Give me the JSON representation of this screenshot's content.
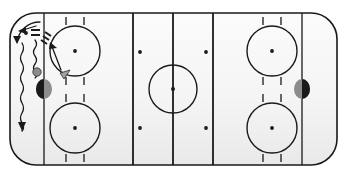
{
  "diagram": {
    "kind": "ice-hockey-rink-drill",
    "canvas": {
      "width": 347,
      "height": 178
    },
    "colors": {
      "ice_fill": "#f6f6f6",
      "ice_fill_shadow": "#ececec",
      "line_stroke": "#1a1a1a",
      "board_stroke": "#1a1a1a",
      "marker_dark": "#1a1a1a",
      "marker_gray": "#8c8c8c",
      "cone_gray": "#a0a0a0",
      "page_background": "#ffffff"
    },
    "rink": {
      "label": "rink-surface",
      "x": 10,
      "y": 13,
      "width": 327,
      "height": 152,
      "corner_radius": 26,
      "board_stroke_width": 1.6
    },
    "lines": [
      {
        "name": "goal-line-left",
        "label": "Goal Line (Left)",
        "x": 44,
        "width": 1.3
      },
      {
        "name": "blue-line-left",
        "label": "Blue Line (Left)",
        "x": 133,
        "width": 1.8
      },
      {
        "name": "center-line",
        "label": "Center Red Line",
        "x": 173,
        "width": 1.8
      },
      {
        "name": "blue-line-right",
        "label": "Blue Line (Right)",
        "x": 213,
        "width": 1.8
      },
      {
        "name": "goal-line-right",
        "label": "Goal Line (Right)",
        "x": 302,
        "width": 1.3
      }
    ],
    "center_circle": {
      "label": "Center Faceoff Circle",
      "cx": 173,
      "cy": 89,
      "r": 24,
      "dot_r": 2.0
    },
    "faceoff_circles": [
      {
        "name": "faceoff-circle-left-top",
        "label": "Left Zone Top Faceoff Circle",
        "cx": 75,
        "cy": 51,
        "r": 25,
        "dot_r": 1.9
      },
      {
        "name": "faceoff-circle-left-bottom",
        "label": "Left Zone Bottom Faceoff Circle",
        "cx": 75,
        "cy": 128,
        "r": 25,
        "dot_r": 1.9
      },
      {
        "name": "faceoff-circle-right-top",
        "label": "Right Zone Top Faceoff Circle",
        "cx": 272,
        "cy": 51,
        "r": 25,
        "dot_r": 1.9
      },
      {
        "name": "faceoff-circle-right-bottom",
        "label": "Right Zone Bottom Faceoff Circle",
        "cx": 272,
        "cy": 128,
        "r": 25,
        "dot_r": 1.9
      }
    ],
    "hash_marks": {
      "offset_x": 9,
      "length": 8,
      "width": 1.3
    },
    "neutral_zone_dots": [
      {
        "name": "neutral-dot-top-left",
        "cx": 140,
        "cy": 52,
        "r": 1.9
      },
      {
        "name": "neutral-dot-top-right",
        "cx": 206,
        "cy": 52,
        "r": 1.9
      },
      {
        "name": "neutral-dot-bottom-left",
        "cx": 140,
        "cy": 128,
        "r": 1.9
      },
      {
        "name": "neutral-dot-bottom-right",
        "cx": 206,
        "cy": 128,
        "r": 1.9
      }
    ],
    "goal_markers": [
      {
        "name": "goal-marker-left",
        "label": "Net (Left Goal)",
        "cx": 44,
        "cy": 89,
        "rx": 8,
        "ry": 10,
        "dark_side": "left"
      },
      {
        "name": "goal-marker-right",
        "label": "Net (Right Goal)",
        "cx": 302,
        "cy": 89,
        "rx": 8,
        "ry": 10,
        "dark_side": "right"
      }
    ],
    "players": [
      {
        "name": "player-marker-corner",
        "label": "Player in Corner",
        "cx": 37,
        "cy": 72,
        "r": 4.2,
        "fill": "#8c8c8c"
      }
    ],
    "puck": {
      "name": "puck-marker",
      "label": "Puck",
      "cx": 26,
      "cy": 33,
      "r": 1.9
    },
    "cone": {
      "name": "cone-marker",
      "label": "Cone / Obstacle",
      "points": "60,73 70,70 64,79",
      "fill": "#a0a0a0"
    },
    "net_symbol": {
      "name": "net-symbol",
      "label": "Net Symbol (double bar)",
      "x": 31,
      "y": 29,
      "width": 9,
      "gap": 3,
      "thickness": 2
    },
    "skating_paths": [
      {
        "name": "skate-path-wavy-outer",
        "label": "Skating Path (Wavy, Outer)",
        "style": "wavy",
        "path": "M 22 43 q 3 5 0 10 q -3 5 0 10 q 3 5 0 10 q -3 5 0 10 q 3 5 0 10 q -3 5 0 10 q 3 5 0 10 q -3 5 0 10 q 3 5 0 8",
        "arrowhead": {
          "points": "22,131 18,122 26,122"
        }
      },
      {
        "name": "skate-path-wavy-inner",
        "label": "Skating Path (Wavy, Inner)",
        "style": "wavy",
        "path": "M 35 40 q 3 4 0 8 q -3 4 0 8 q 3 4 0 8 q -3 4 0 8 q 3 4 0 6",
        "arrowhead": null
      }
    ],
    "pass_arrows": [
      {
        "name": "pass-arrow-upper-left",
        "label": "Pass / Movement Arrow (to upper left)",
        "style": "straight",
        "path": "M 36 26 L 20 31",
        "arrowhead": {
          "points": "18,31 26,27 26,34"
        }
      },
      {
        "name": "pass-arrow-board-curve",
        "label": "Puck Movement Along Boards",
        "style": "curve",
        "path": "M 40 22 C 28 22 19 30 17 42",
        "arrowhead": {
          "points": "17,44 13,36 21,36"
        }
      },
      {
        "name": "shot-arrow-to-circle",
        "label": "Shot / Drive Arrow to Faceoff Circle",
        "style": "straight",
        "path": "M 61 70 L 51 44",
        "arrowhead": {
          "points": "50,42 57,48 49,49"
        }
      },
      {
        "name": "stick-hash-marks",
        "label": "Stick / Hash Marks",
        "style": "hash",
        "segments": [
          "M 45 32 L 51 36",
          "M 43 36 L 49 40",
          "M 41 40 L 47 44"
        ]
      }
    ]
  }
}
